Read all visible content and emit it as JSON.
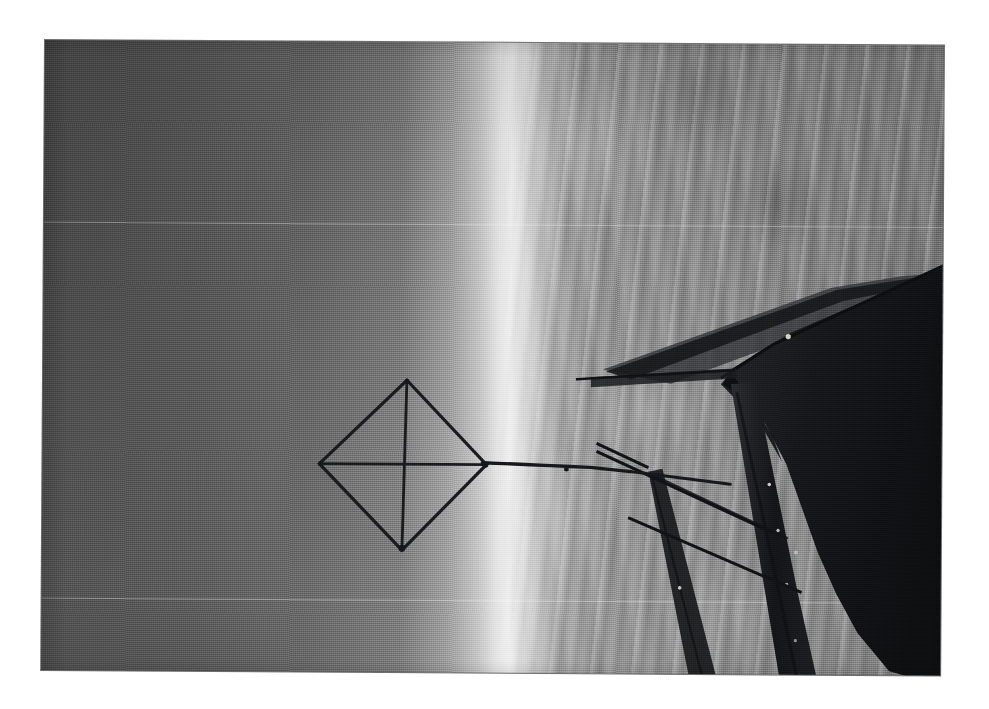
{
  "page": {
    "background_color": "#ffffff",
    "width": 989,
    "height": 709,
    "caption": ""
  },
  "photograph": {
    "title": "Kite flown from an aircraft wing strut, aerial view",
    "medium": "black-and-white scanned photographic print",
    "orientation_note": "image is rotated 90 degrees: horizon runs vertically",
    "frame": {
      "left": 45,
      "top": 40,
      "width": 899,
      "height": 630,
      "rotation_deg": 0.35,
      "border_color": "#6e6e6e"
    },
    "tones": {
      "sky_dark": "#4a4a4a",
      "sky_mid": "#787878",
      "horizon_highlight": "#efefef",
      "ground_mid": "#949494",
      "structure_dark": "#16171a",
      "paper_white": "#ffffff"
    },
    "regions": [
      {
        "name": "sky",
        "description": "Smooth dark-to-light gradient occupying the left half of the frame"
      },
      {
        "name": "horizon-band",
        "description": "Bright vertical highlight band running top to bottom near the middle"
      },
      {
        "name": "landscape",
        "description": "Textured aerial terrain with fields, roads and tracks filling the right half"
      }
    ],
    "subjects": [
      {
        "name": "kite",
        "description": "Diamond box kite with cross spars, silhouetted against the sky"
      },
      {
        "name": "kite-line",
        "description": "Taut line running from the kite to the aircraft"
      },
      {
        "name": "wing",
        "description": "Dark silhouetted aircraft wing entering from the right edge"
      },
      {
        "name": "strut",
        "description": "Vertical interplane strut below the wing"
      },
      {
        "name": "bracing-wires",
        "description": "Diagonal rigging wires crossing the lower right of the frame"
      }
    ],
    "artifacts": [
      {
        "name": "scanline-upper",
        "y": 222
      },
      {
        "name": "scanline-lower",
        "y": 598
      }
    ]
  }
}
